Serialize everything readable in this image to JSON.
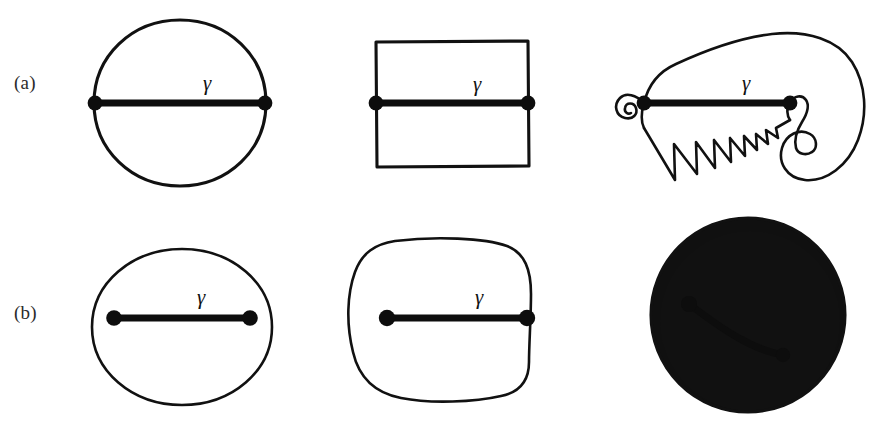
{
  "figure": {
    "background_color": "#ffffff",
    "ink_color": "#111111",
    "label_color": "#2b2b2b",
    "rows": [
      {
        "id": "a",
        "label": "(a)",
        "description": "curves with endpoints on the boundary",
        "panels": [
          {
            "id": "a1",
            "shape_name": "circle",
            "curve_label": "γ",
            "curve_kind": "straight-diameter",
            "endpoints_on_boundary": true
          },
          {
            "id": "a2",
            "shape_name": "rectangle",
            "curve_label": "γ",
            "curve_kind": "straight-horizontal",
            "endpoints_on_boundary": true
          },
          {
            "id": "a3",
            "shape_name": "irregular-blob-with-spiral-and-sawtooth",
            "curve_label": "γ",
            "curve_kind": "straight-horizontal",
            "endpoints_on_boundary": true
          }
        ]
      },
      {
        "id": "b",
        "label": "(b)",
        "description": "curves lying inside the region",
        "panels": [
          {
            "id": "b1",
            "shape_name": "ellipse",
            "curve_label": "γ",
            "curve_kind": "straight-horizontal",
            "endpoints_on_boundary": false
          },
          {
            "id": "b2",
            "shape_name": "rounded-square-blob",
            "curve_label": "γ",
            "curve_kind": "straight-horizontal",
            "endpoints_on_boundary": false
          },
          {
            "id": "b3",
            "shape_name": "shaded-sphere",
            "curve_label": "γ",
            "curve_kind": "curved-arc",
            "endpoints_on_boundary": false
          }
        ]
      }
    ]
  }
}
